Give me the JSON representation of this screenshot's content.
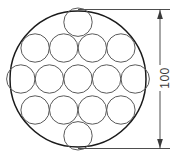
{
  "diagram": {
    "type": "engineering-drawing",
    "canvas": {
      "width": 178,
      "height": 160,
      "background": "#ffffff"
    },
    "outer_circle": {
      "name": "outer-boundary-circle",
      "center_x": 78,
      "center_y": 79,
      "radius": 68,
      "diameter": 136,
      "stroke_color": "#1a1a1a",
      "stroke_width": 1.5
    },
    "packed_circles": {
      "count": 15,
      "radius": 14.2,
      "diameter": 28.4,
      "stroke_color": "#5a5a5a",
      "stroke_width": 1,
      "row_counts": [
        1,
        4,
        5,
        4,
        1
      ],
      "positions": [
        {
          "cx": 78.0,
          "cy": 22.2
        },
        {
          "cx": 49.4,
          "cy": 46.8
        },
        {
          "cx": 78.0,
          "cy": 46.8
        },
        {
          "cx": 106.6,
          "cy": 46.8
        },
        {
          "cx": 135.2,
          "cy": 46.8
        },
        {
          "cx": 20.8,
          "cy": 46.8
        },
        {
          "cx": 20.8,
          "cy": 79.0
        },
        {
          "cx": 49.4,
          "cy": 79.0
        },
        {
          "cx": 78.0,
          "cy": 79.0
        },
        {
          "cx": 106.6,
          "cy": 79.0
        },
        {
          "cx": 135.2,
          "cy": 79.0
        },
        {
          "cx": 49.4,
          "cy": 111.2
        },
        {
          "cx": 78.0,
          "cy": 111.2
        },
        {
          "cx": 106.6,
          "cy": 111.2
        },
        {
          "cx": 78.0,
          "cy": 135.8
        }
      ]
    },
    "dimension": {
      "name": "overall-diameter-dimension",
      "label": "100",
      "orientation": "vertical",
      "rotation_degrees": -90,
      "line_x": 160,
      "top_y": 9,
      "bottom_y": 149,
      "extension_top_y": 9,
      "extension_bottom_y": 149,
      "extension_start_x": 78,
      "extension_end_x": 170,
      "arrow_style": "filled-solid",
      "stroke_color": "#3a3a3a",
      "label_color": "#3a3a3a",
      "label_font_size": 12
    }
  }
}
